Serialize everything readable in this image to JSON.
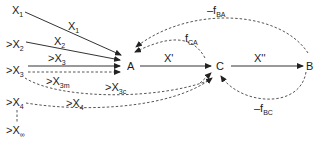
{
  "diagram": {
    "type": "flow-network",
    "nodes": {
      "A": "A",
      "C": "C",
      "B": "B"
    },
    "inputs": [
      {
        "prefix": "",
        "base": "X",
        "sub": "1"
      },
      {
        "prefix": ">",
        "base": "X",
        "sub": "2"
      },
      {
        "prefix": ">",
        "base": "X",
        "sub": "3"
      },
      {
        "prefix": ">",
        "base": "X",
        "sub": "4"
      },
      {
        "prefix": ">",
        "base": "X",
        "sub": "∞"
      }
    ],
    "edge_labels": {
      "x1": {
        "base": "X",
        "sub": "1"
      },
      "x2": {
        "base": "X",
        "sub": "2"
      },
      "x3": {
        "base": ">X",
        "sub": "3"
      },
      "x3m": {
        "base": ">X",
        "sub": "3m"
      },
      "x3c": {
        "base": ">X",
        "sub": "3c"
      },
      "x4": {
        "base": ">X",
        "sub": "4"
      },
      "ac": "X'",
      "cb": "X''",
      "fca": {
        "base": "f",
        "sub": "CA"
      },
      "fba": {
        "base": "–f",
        "sub": "BA"
      },
      "fbc": {
        "base": "–f",
        "sub": "BC"
      }
    }
  }
}
